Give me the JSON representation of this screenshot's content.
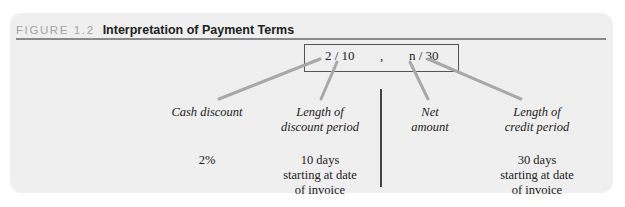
{
  "figure": {
    "label": "FIGURE 1.2",
    "title": "Interpretation of Payment Terms"
  },
  "terms": {
    "discount_part": "2 / 10",
    "separator": ",",
    "net_part": "n / 30"
  },
  "columns": [
    {
      "label_line1": "Cash discount",
      "label_line2": "",
      "value_lines": [
        "2%"
      ]
    },
    {
      "label_line1": "Length of",
      "label_line2": "discount period",
      "value_lines": [
        "10 days",
        "starting at date",
        "of invoice"
      ]
    },
    {
      "label_line1": "Net",
      "label_line2": "amount",
      "value_lines": []
    },
    {
      "label_line1": "Length of",
      "label_line2": "credit period",
      "value_lines": [
        "30 days",
        "starting at date",
        "of invoice"
      ]
    }
  ],
  "colors": {
    "panel_bg": "#efefef",
    "arrow": "#a8a8a8",
    "rule": "#8a8a8a",
    "figure_label": "#a3a3a3"
  }
}
